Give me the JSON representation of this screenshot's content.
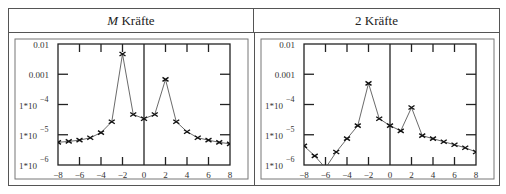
{
  "table": {
    "headers": [
      {
        "prefix": "M",
        "label": " Kräfte"
      },
      {
        "prefix": "",
        "label": "2 Kräfte"
      }
    ]
  },
  "chart_data": [
    {
      "type": "line",
      "title": "M Kräfte",
      "xlabel": "",
      "ylabel": "",
      "yscale": "log",
      "ylim": [
        1e-06,
        0.01
      ],
      "xlim": [
        -8,
        8
      ],
      "grid": false,
      "marker": "x",
      "x_ticks": [
        "-8",
        "-6",
        "-4",
        "-2",
        "0",
        "2",
        "4",
        "6",
        "8"
      ],
      "y_ticks": [
        "0.01",
        "0.001",
        "1*10^-4",
        "1*10^-5",
        "1*10^-6"
      ],
      "x": [
        -8,
        -7,
        -6,
        -5,
        -4,
        -3,
        -2,
        -1,
        0,
        1,
        2,
        3,
        4,
        5,
        6,
        7,
        8
      ],
      "log10_values": [
        -5.25,
        -5.22,
        -5.18,
        -5.1,
        -4.93,
        -4.57,
        -2.33,
        -4.33,
        -4.47,
        -4.33,
        -3.17,
        -4.57,
        -4.9,
        -5.1,
        -5.18,
        -5.25,
        -5.3
      ],
      "values": [
        5.6e-06,
        6e-06,
        6.6e-06,
        7.9e-06,
        1.2e-05,
        2.7e-05,
        0.0047,
        4.7e-05,
        3.4e-05,
        4.7e-05,
        0.00068,
        2.7e-05,
        1.3e-05,
        7.9e-06,
        6.6e-06,
        5.6e-06,
        5e-06
      ]
    },
    {
      "type": "line",
      "title": "2 Kräfte",
      "xlabel": "",
      "ylabel": "",
      "yscale": "log",
      "ylim": [
        1e-06,
        0.01
      ],
      "xlim": [
        -8,
        8
      ],
      "grid": false,
      "marker": "x",
      "x_ticks": [
        "-8",
        "-6",
        "-4",
        "-2",
        "0",
        "2",
        "4",
        "6",
        "8"
      ],
      "y_ticks": [
        "0.01",
        "0.001",
        "1*10^-4",
        "1*10^-5",
        "1*10^-6"
      ],
      "x": [
        -8,
        -7,
        -6,
        -5,
        -4,
        -3,
        -2,
        -1,
        0,
        1,
        2,
        3,
        4,
        5,
        6,
        7,
        8
      ],
      "log10_values": [
        -5.37,
        -5.7,
        -6.1,
        -5.57,
        -5.13,
        -4.7,
        -3.3,
        -4.47,
        -4.7,
        -4.87,
        -4.1,
        -5.03,
        -5.13,
        -5.23,
        -5.33,
        -5.43,
        -5.57
      ],
      "values": [
        4.3e-06,
        2e-06,
        7.9e-07,
        2.7e-06,
        7.4e-06,
        2e-05,
        0.0005,
        3.4e-05,
        2e-05,
        1.3e-05,
        7.9e-05,
        9.3e-06,
        7.4e-06,
        5.9e-06,
        4.7e-06,
        3.7e-06,
        2.7e-06
      ]
    }
  ],
  "axis": {
    "y_labels": [
      {
        "text": "0.01",
        "log": -2,
        "exp": ""
      },
      {
        "text": "0.001",
        "log": -3,
        "exp": ""
      },
      {
        "text": "1*10",
        "log": -4,
        "exp": "−4"
      },
      {
        "text": "1*10",
        "log": -5,
        "exp": "−5"
      },
      {
        "text": "1*10",
        "log": -6,
        "exp": "−6"
      }
    ],
    "x_labels": [
      {
        "v": -8,
        "text": "−8"
      },
      {
        "v": -6,
        "text": "−6"
      },
      {
        "v": -4,
        "text": "−4"
      },
      {
        "v": -2,
        "text": "−2"
      },
      {
        "v": 0,
        "text": "0"
      },
      {
        "v": 2,
        "text": "2"
      },
      {
        "v": 4,
        "text": "4"
      },
      {
        "v": 6,
        "text": "6"
      },
      {
        "v": 8,
        "text": "8"
      }
    ]
  }
}
